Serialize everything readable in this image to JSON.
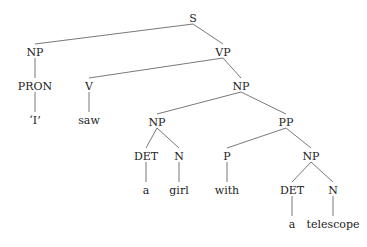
{
  "diagram": {
    "type": "syntax-tree",
    "nodes": [
      {
        "id": "S",
        "label": "S",
        "x": 193,
        "y": 18
      },
      {
        "id": "NP1",
        "label": "NP",
        "x": 35,
        "y": 52
      },
      {
        "id": "VP",
        "label": "VP",
        "x": 223,
        "y": 52
      },
      {
        "id": "PRON",
        "label": "PRON",
        "x": 35,
        "y": 86
      },
      {
        "id": "V",
        "label": "V",
        "x": 89,
        "y": 86
      },
      {
        "id": "NP2",
        "label": "NP",
        "x": 241,
        "y": 86
      },
      {
        "id": "I",
        "label": "‘I’",
        "x": 35,
        "y": 120
      },
      {
        "id": "saw",
        "label": "saw",
        "x": 89,
        "y": 120
      },
      {
        "id": "NP3",
        "label": "NP",
        "x": 157,
        "y": 122
      },
      {
        "id": "PP",
        "label": "PP",
        "x": 286,
        "y": 122
      },
      {
        "id": "DET1",
        "label": "DET",
        "x": 146,
        "y": 156
      },
      {
        "id": "N1",
        "label": "N",
        "x": 179,
        "y": 156
      },
      {
        "id": "P",
        "label": "P",
        "x": 227,
        "y": 156
      },
      {
        "id": "NP4",
        "label": "NP",
        "x": 311,
        "y": 156
      },
      {
        "id": "a1",
        "label": "a",
        "x": 146,
        "y": 190
      },
      {
        "id": "girl",
        "label": "girl",
        "x": 179,
        "y": 190
      },
      {
        "id": "with",
        "label": "with",
        "x": 227,
        "y": 190
      },
      {
        "id": "DET2",
        "label": "DET",
        "x": 292,
        "y": 190
      },
      {
        "id": "N2",
        "label": "N",
        "x": 333,
        "y": 190
      },
      {
        "id": "a2",
        "label": "a",
        "x": 292,
        "y": 224
      },
      {
        "id": "telescope",
        "label": "telescope",
        "x": 333,
        "y": 224
      }
    ],
    "edges": [
      [
        "S",
        "NP1"
      ],
      [
        "S",
        "VP"
      ],
      [
        "NP1",
        "PRON"
      ],
      [
        "PRON",
        "I"
      ],
      [
        "VP",
        "V"
      ],
      [
        "VP",
        "NP2"
      ],
      [
        "V",
        "saw"
      ],
      [
        "NP2",
        "NP3"
      ],
      [
        "NP2",
        "PP"
      ],
      [
        "NP3",
        "DET1"
      ],
      [
        "NP3",
        "N1"
      ],
      [
        "DET1",
        "a1"
      ],
      [
        "N1",
        "girl"
      ],
      [
        "PP",
        "P"
      ],
      [
        "PP",
        "NP4"
      ],
      [
        "P",
        "with"
      ],
      [
        "NP4",
        "DET2"
      ],
      [
        "NP4",
        "N2"
      ],
      [
        "DET2",
        "a2"
      ],
      [
        "N2",
        "telescope"
      ]
    ]
  }
}
